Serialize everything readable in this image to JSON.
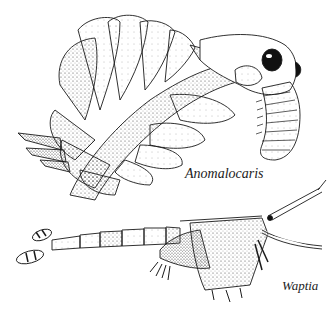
{
  "figure": {
    "labels": {
      "anomalocaris": "Anomalocaris",
      "waptia": "Waptia"
    },
    "colors": {
      "ink": "#1a1a1a",
      "paper": "#ffffff",
      "stipple": "#555555"
    }
  }
}
